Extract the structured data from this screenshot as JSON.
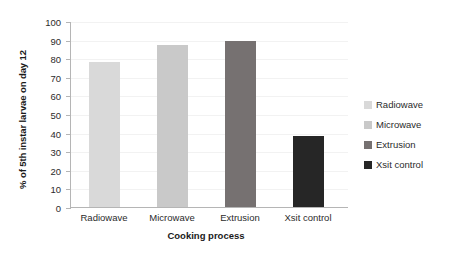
{
  "chart_data": {
    "type": "bar",
    "title": "",
    "categories": [
      "Radiowave",
      "Microwave",
      "Extrusion",
      "Xsit control"
    ],
    "values": [
      78,
      87,
      89,
      38
    ],
    "xlabel": "Cooking process",
    "ylabel": "% of 5th instar larvae on day 12",
    "ylim": [
      0,
      100
    ],
    "ytick_step": 10,
    "yticks": [
      100,
      90,
      80,
      70,
      60,
      50,
      40,
      30,
      20,
      10,
      0
    ],
    "grid": true,
    "legend_position": "right",
    "legend": [
      {
        "label": "Radiowave",
        "color": "#d9d9d9"
      },
      {
        "label": "Microwave",
        "color": "#c9c9c9"
      },
      {
        "label": "Extrusion",
        "color": "#767171"
      },
      {
        "label": "Xsit control",
        "color": "#262626"
      }
    ],
    "bar_colors": [
      "#d9d9d9",
      "#c9c9c9",
      "#767171",
      "#262626"
    ]
  }
}
